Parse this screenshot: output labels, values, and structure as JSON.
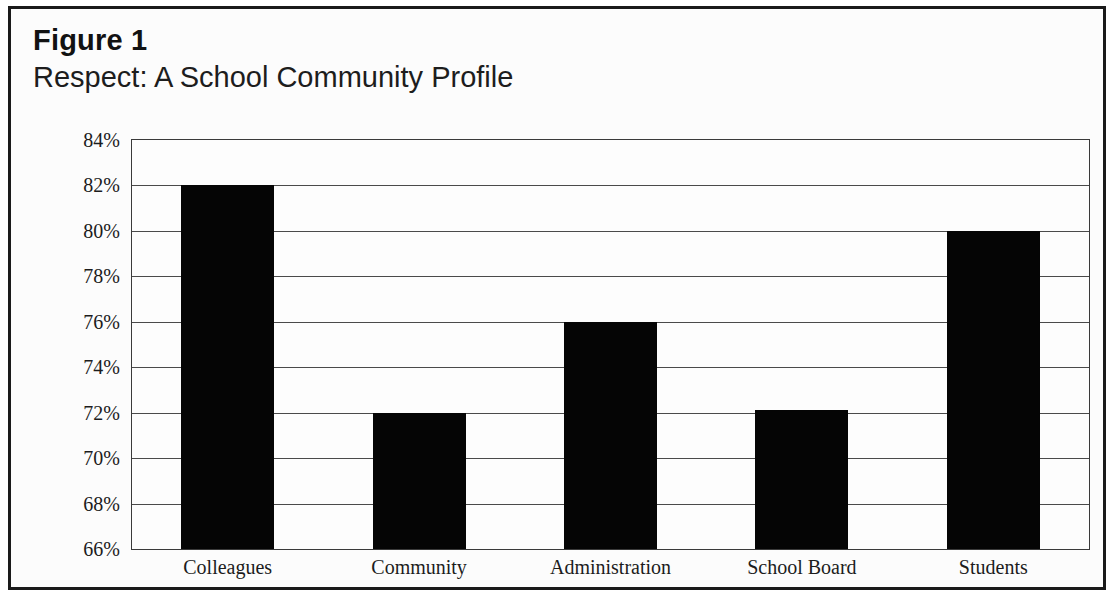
{
  "figure": {
    "number_label": "Figure 1",
    "subtitle": "Respect: A School Community Profile"
  },
  "chart_data": {
    "type": "bar",
    "title": "Respect: A School Community Profile",
    "subtitle": "Figure 1",
    "xlabel": "",
    "ylabel": "",
    "categories": [
      "Colleagues",
      "Community",
      "Administration",
      "School Board",
      "Students"
    ],
    "values": [
      82,
      72,
      76,
      72.1,
      80
    ],
    "value_labels": [
      "82%",
      "72%",
      "76%",
      "72%",
      "80%"
    ],
    "ylim": [
      66,
      84
    ],
    "ytick_values": [
      84,
      82,
      80,
      78,
      76,
      74,
      72,
      70,
      68,
      66
    ],
    "ytick_labels": [
      "84%",
      "82%",
      "80%",
      "78%",
      "76%",
      "74%",
      "72%",
      "70%",
      "68%",
      "66%"
    ],
    "grid": true,
    "legend": false,
    "bar_color": "#050505",
    "grid_color": "#4a4a4a",
    "axis_color": "#3a3a3a",
    "background_color": "#fcfcfc"
  }
}
